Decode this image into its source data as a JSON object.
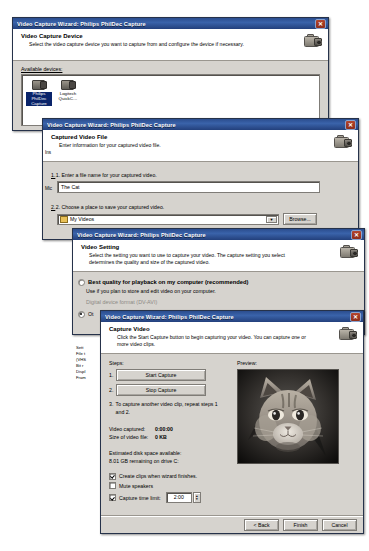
{
  "app": {
    "window_title": "Video Capture Wizard: Philips PhilDec Capture",
    "close_glyph": "✕"
  },
  "dialog1": {
    "title": "Video Capture Wizard: Philips PhilDec Capture",
    "heading": "Video Capture Device",
    "subheading": "Select the video capture device you want to capture from and configure the device if necessary.",
    "devices_label": "Available devices:",
    "devices": [
      {
        "label_line1": "Philips PhilDec",
        "label_line2": "Capture",
        "selected": true
      },
      {
        "label_line1": "Logitech",
        "label_line2": "QuickC…",
        "selected": false
      }
    ]
  },
  "dialog2": {
    "title": "Video Capture Wizard: Philips PhilDec Capture",
    "heading": "Captured Video File",
    "subheading": "Enter information for your captured video file.",
    "step1_label": "1. Enter a file name for your captured video.",
    "file_name_value": "The Cat",
    "file_name_placeholder": "",
    "step2_label": "2. Choose a place to save your captured video.",
    "save_location_value": "My Videos",
    "browse_button": "Browse...",
    "left_sliver_1": "Ins",
    "left_sliver_2": "Mic"
  },
  "dialog3": {
    "title": "Video Capture Wizard: Philips PhilDec Capture",
    "heading": "Video Setting",
    "subheading": "Select the setting you want to use to capture your video. The capture setting you select determines the quality and size of the captured video.",
    "option_best_quality": "Best quality for playback on my computer (recommended)",
    "option_best_quality_desc": "Use if you plan to store and edit video on your computer.",
    "option_dv_format": "Digital device format (DV-AVI)",
    "option_other": "Ot",
    "side_labels": [
      "Sett",
      "File t",
      "(VHS",
      "Bit r",
      "Displ",
      "Fram"
    ]
  },
  "dialog4": {
    "title": "Video Capture Wizard: Philips PhilDec Capture",
    "heading": "Capture Video",
    "subheading": "Click the Start Capture button to begin capturing your video. You can capture one or more video clips.",
    "steps_label": "Steps:",
    "step1_num": "1.",
    "step2_num": "2.",
    "start_capture_button": "Start Capture",
    "stop_capture_button": "Stop Capture",
    "step3_num": "3.",
    "step3_text": "To capture another video clip, repeat steps 1 and 2.",
    "video_captured_label": "Video captured:",
    "video_captured_value": "0:00:00",
    "video_size_label": "Size of video file:",
    "video_size_value": "0 KB",
    "disk_space_label": "Estimated disk space available:",
    "disk_space_value": "8.01 GB remaining on drive C:",
    "checkbox_create_clips": "Create clips when wizard finishes.",
    "checkbox_create_clips_checked": true,
    "checkbox_mute": "Mute speakers",
    "checkbox_mute_checked": false,
    "checkbox_time_limit": "Capture time limit:",
    "checkbox_time_limit_checked": true,
    "time_limit_value": "2:00",
    "preview_label": "Preview:",
    "preview_alt": "grayscale tabby cat face",
    "back_button": "< Back",
    "finish_button": "Finish",
    "cancel_button": "Cancel"
  }
}
